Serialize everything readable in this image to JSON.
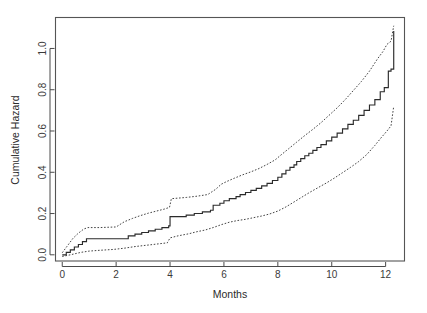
{
  "chart_data": {
    "type": "line",
    "title": "",
    "subtitle": "",
    "xlabel": "Months",
    "ylabel": "Cumulative Hazard",
    "xlim": [
      -0.25,
      12.7
    ],
    "ylim": [
      -0.03,
      1.15
    ],
    "xticks": [
      0,
      2,
      4,
      6,
      8,
      10,
      12
    ],
    "xtick_labels": [
      "0",
      "2",
      "4",
      "6",
      "8",
      "10",
      "12"
    ],
    "yticks": [
      0.0,
      0.2,
      0.4,
      0.6,
      0.8,
      1.0
    ],
    "ytick_labels": [
      "0.0",
      "0.2",
      "0.4",
      "0.6",
      "0.8",
      "1.0"
    ],
    "grid": false,
    "legend_position": "none",
    "style": {
      "estimate_stroke": "#2b2b2b",
      "ci_stroke": "#3a3a3a",
      "ci_dash": "dotted",
      "frame_stroke": "#555555",
      "background": "#ffffff"
    },
    "series": [
      {
        "name": "Cumulative hazard estimate",
        "line_style": "solid",
        "step": true,
        "x": [
          0.0,
          0.15,
          0.3,
          0.45,
          0.6,
          0.75,
          0.9,
          2.2,
          2.45,
          2.7,
          2.95,
          3.2,
          3.45,
          3.7,
          3.95,
          4.0,
          4.6,
          4.9,
          5.2,
          5.5,
          5.6,
          5.85,
          6.0,
          6.2,
          6.45,
          6.6,
          6.8,
          7.0,
          7.2,
          7.4,
          7.6,
          7.8,
          8.0,
          8.15,
          8.3,
          8.45,
          8.6,
          8.7,
          8.85,
          9.0,
          9.15,
          9.3,
          9.45,
          9.6,
          9.8,
          10.0,
          10.2,
          10.4,
          10.6,
          10.8,
          11.0,
          11.2,
          11.4,
          11.6,
          11.8,
          11.95,
          12.1,
          12.2,
          12.3
        ],
        "y": [
          0.0,
          0.012,
          0.024,
          0.038,
          0.05,
          0.064,
          0.078,
          0.078,
          0.092,
          0.1,
          0.108,
          0.116,
          0.124,
          0.132,
          0.14,
          0.185,
          0.192,
          0.2,
          0.208,
          0.216,
          0.24,
          0.25,
          0.262,
          0.272,
          0.282,
          0.292,
          0.302,
          0.312,
          0.322,
          0.334,
          0.346,
          0.36,
          0.376,
          0.392,
          0.41,
          0.424,
          0.436,
          0.452,
          0.466,
          0.48,
          0.492,
          0.506,
          0.52,
          0.534,
          0.552,
          0.57,
          0.59,
          0.61,
          0.632,
          0.652,
          0.676,
          0.7,
          0.726,
          0.752,
          0.79,
          0.81,
          0.89,
          0.9,
          1.085
        ]
      },
      {
        "name": "Upper 95% confidence limit",
        "line_style": "dotted",
        "step": false,
        "x": [
          0.0,
          0.2,
          0.4,
          0.6,
          0.8,
          0.95,
          1.4,
          2.0,
          2.3,
          2.6,
          2.9,
          3.2,
          3.5,
          3.8,
          3.98,
          4.05,
          4.6,
          5.0,
          5.4,
          5.7,
          5.9,
          6.1,
          6.4,
          6.7,
          7.0,
          7.3,
          7.6,
          7.9,
          8.1,
          8.4,
          8.7,
          9.0,
          9.3,
          9.6,
          9.9,
          10.2,
          10.5,
          10.8,
          11.1,
          11.4,
          11.7,
          11.9,
          12.05,
          12.2,
          12.3
        ],
        "y": [
          0.01,
          0.045,
          0.08,
          0.105,
          0.125,
          0.132,
          0.132,
          0.135,
          0.16,
          0.176,
          0.19,
          0.202,
          0.212,
          0.222,
          0.23,
          0.272,
          0.278,
          0.284,
          0.292,
          0.318,
          0.342,
          0.355,
          0.372,
          0.388,
          0.402,
          0.418,
          0.438,
          0.46,
          0.482,
          0.514,
          0.546,
          0.578,
          0.608,
          0.64,
          0.676,
          0.712,
          0.752,
          0.796,
          0.84,
          0.89,
          0.95,
          0.985,
          1.02,
          1.035,
          1.11
        ]
      },
      {
        "name": "Lower 95% confidence limit",
        "line_style": "dotted",
        "step": false,
        "x": [
          0.0,
          0.3,
          0.7,
          1.0,
          1.4,
          1.9,
          2.3,
          2.7,
          3.1,
          3.5,
          3.9,
          4.0,
          4.3,
          4.7,
          5.0,
          5.3,
          5.6,
          5.9,
          6.2,
          6.5,
          6.8,
          7.1,
          7.4,
          7.7,
          8.0,
          8.3,
          8.6,
          8.9,
          9.2,
          9.5,
          9.8,
          10.1,
          10.4,
          10.7,
          11.0,
          11.3,
          11.6,
          11.85,
          12.05,
          12.2,
          12.3
        ],
        "y": [
          -0.008,
          0.0,
          0.012,
          0.018,
          0.022,
          0.026,
          0.032,
          0.04,
          0.046,
          0.052,
          0.058,
          0.082,
          0.092,
          0.102,
          0.112,
          0.12,
          0.132,
          0.146,
          0.158,
          0.166,
          0.172,
          0.18,
          0.188,
          0.198,
          0.212,
          0.232,
          0.256,
          0.28,
          0.304,
          0.326,
          0.348,
          0.372,
          0.398,
          0.424,
          0.452,
          0.486,
          0.53,
          0.57,
          0.6,
          0.625,
          0.72
        ]
      }
    ]
  }
}
